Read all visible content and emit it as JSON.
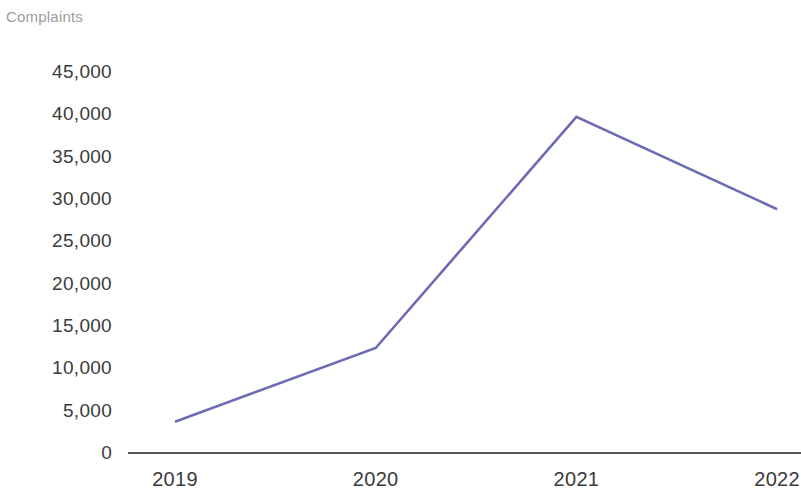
{
  "chart_data": {
    "type": "line",
    "title": "Complaints",
    "xlabel": "",
    "ylabel": "Complaints",
    "categories": [
      "2019",
      "2020",
      "2021",
      "2022"
    ],
    "series": [
      {
        "name": "Complaints",
        "values": [
          3700,
          12400,
          39700,
          28800
        ],
        "color": "#6c6cb4"
      }
    ],
    "ylim": [
      0,
      45000
    ],
    "y_ticks": [
      0,
      5000,
      10000,
      15000,
      20000,
      25000,
      30000,
      35000,
      40000,
      45000
    ],
    "y_tick_labels": [
      "0",
      "5,000",
      "10,000",
      "15,000",
      "20,000",
      "25,000",
      "30,000",
      "35,000",
      "40,000",
      "45,000"
    ],
    "x_tick_labels": [
      "2019",
      "2020",
      "2021",
      "2022"
    ],
    "grid": false,
    "legend": "none",
    "axis_color": "#555555",
    "title_color": "#9b9b9b",
    "tick_label_color": "#3b3b3b",
    "note": "rightmost 2022 label is clipped by the image edge"
  }
}
